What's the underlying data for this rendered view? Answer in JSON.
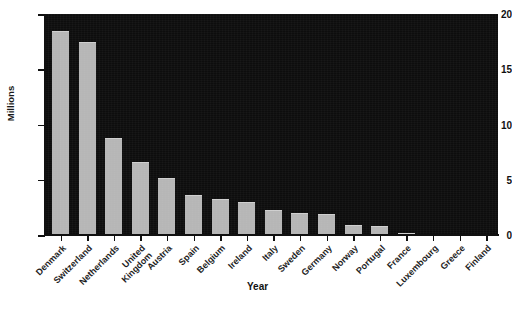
{
  "chart_data": {
    "type": "bar",
    "title": "",
    "xlabel": "Year",
    "ylabel": "Millions",
    "ylim": [
      0,
      20
    ],
    "yticks": [
      0,
      5,
      10,
      15,
      20
    ],
    "grid": false,
    "legend": null,
    "bar_color": "#b6b6b6",
    "plot_background": "#0d0d0d",
    "categories": [
      "Denmark",
      "Switzerland",
      "Netherlands",
      "United Kingdom",
      "Austria",
      "Spain",
      "Belgium",
      "Ireland",
      "Italy",
      "Sweden",
      "Germany",
      "Norway",
      "Portugal",
      "France",
      "Luxembourg",
      "Greece",
      "Finland"
    ],
    "category_lines": [
      [
        "Denmark"
      ],
      [
        "Switzerland"
      ],
      [
        "Netherlands"
      ],
      [
        "United",
        "Kingdom"
      ],
      [
        "Austria"
      ],
      [
        "Spain"
      ],
      [
        "Belgium"
      ],
      [
        "Ireland"
      ],
      [
        "Italy"
      ],
      [
        "Sweden"
      ],
      [
        "Germany"
      ],
      [
        "Norway"
      ],
      [
        "Portugal"
      ],
      [
        "France"
      ],
      [
        "Luxembourg"
      ],
      [
        "Greece"
      ],
      [
        "Finland"
      ]
    ],
    "values": [
      18.5,
      17.5,
      8.8,
      6.6,
      5.2,
      3.6,
      3.3,
      3.0,
      2.3,
      2.0,
      1.9,
      0.9,
      0.85,
      0.2,
      0,
      0,
      0
    ]
  }
}
